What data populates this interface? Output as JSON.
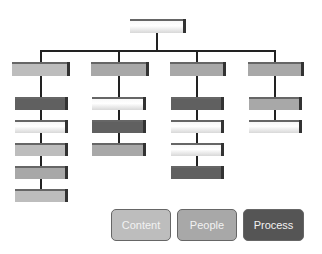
{
  "diagram": {
    "type": "org-chart",
    "root": {
      "shade": "white"
    },
    "columns": [
      {
        "head": "light",
        "children": [
          "dark",
          "white",
          "light",
          "mid",
          "light"
        ]
      },
      {
        "head": "mid",
        "children": [
          "white",
          "dark",
          "mid"
        ]
      },
      {
        "head": "mid",
        "children": [
          "dark",
          "white",
          "white",
          "dark"
        ]
      },
      {
        "head": "mid",
        "children": [
          "mid",
          "white"
        ]
      }
    ]
  },
  "legend": {
    "items": [
      {
        "label": "Content",
        "color": "#bdbdbd"
      },
      {
        "label": "People",
        "color": "#a8a8a8"
      },
      {
        "label": "Process",
        "color": "#555555"
      }
    ]
  }
}
